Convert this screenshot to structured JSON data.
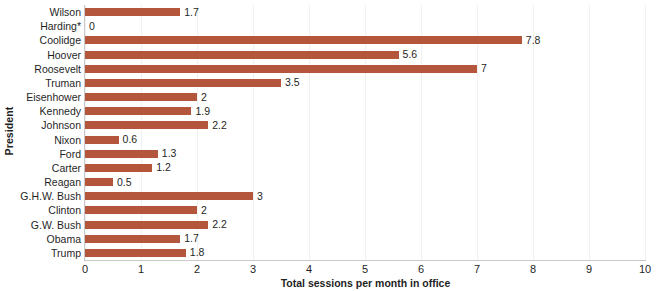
{
  "chart_data": {
    "type": "bar",
    "orientation": "horizontal",
    "title": "",
    "xlabel": "Total sessions per month in office",
    "ylabel": "President",
    "xlim": [
      0,
      10
    ],
    "xticks": [
      "0",
      "1",
      "2",
      "3",
      "4",
      "5",
      "6",
      "7",
      "8",
      "9",
      "10"
    ],
    "grid": "vertical",
    "legend": "none",
    "bar_color": "#b4563c",
    "categories": [
      "Wilson",
      "Harding*",
      "Coolidge",
      "Hoover",
      "Roosevelt",
      "Truman",
      "Eisenhower",
      "Kennedy",
      "Johnson",
      "Nixon",
      "Ford",
      "Carter",
      "Reagan",
      "G.H.W. Bush",
      "Clinton",
      "G.W. Bush",
      "Obama",
      "Trump"
    ],
    "values": [
      1.7,
      0,
      7.8,
      5.6,
      7,
      3.5,
      2,
      1.9,
      2.2,
      0.6,
      1.3,
      1.2,
      0.5,
      3,
      2,
      2.2,
      1.7,
      1.8
    ],
    "value_labels": [
      "1.7",
      "0",
      "7.8",
      "5.6",
      "7",
      "3.5",
      "2",
      "1.9",
      "2.2",
      "0.6",
      "1.3",
      "1.2",
      "0.5",
      "3",
      "2",
      "2.2",
      "1.7",
      "1.8"
    ]
  }
}
